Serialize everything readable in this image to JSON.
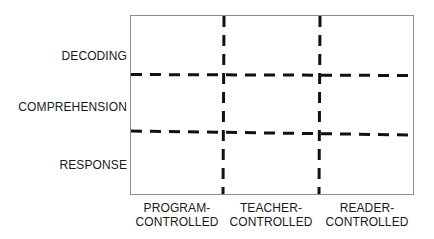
{
  "diagram": {
    "type": "matrix",
    "rows": [
      {
        "label": "DECODING"
      },
      {
        "label": "COMPREHENSION"
      },
      {
        "label": "RESPONSE"
      }
    ],
    "columns": [
      {
        "label": "PROGRAM-\nCONTROLLED"
      },
      {
        "label": "TEACHER-\nCONTROLLED"
      },
      {
        "label": "READER-\nCONTROLLED"
      }
    ],
    "divider_style": "dashed",
    "colors": {
      "border": "#8c8c8c",
      "divider": "#111111",
      "text": "#1a1a1a",
      "background": "#ffffff"
    }
  }
}
